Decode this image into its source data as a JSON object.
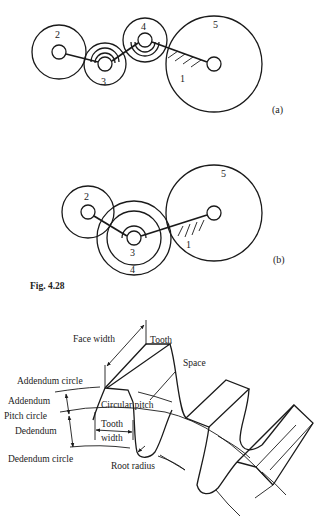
{
  "figure": {
    "caption": "Fig. 4.28",
    "subfigures": [
      {
        "tag": "(a)",
        "gear_labels": [
          "2",
          "3",
          "4",
          "5",
          "1"
        ]
      },
      {
        "tag": "(b)",
        "gear_labels": [
          "2",
          "3",
          "4",
          "5",
          "1"
        ]
      }
    ]
  },
  "tooth_diagram": {
    "labels": {
      "face_width": "Face width",
      "tooth": "Tooth",
      "space": "Space",
      "addendum_circle": "Addendum circle",
      "addendum": "Addendum",
      "pitch_circle": "Pitch circle",
      "dedendum": "Dedendum",
      "dedendum_circle": "Dedendum circle",
      "circular_pitch": "Circular pitch",
      "tooth_width_line1": "Tooth",
      "tooth_width_line2": "width",
      "root_radius": "Root radius"
    }
  }
}
